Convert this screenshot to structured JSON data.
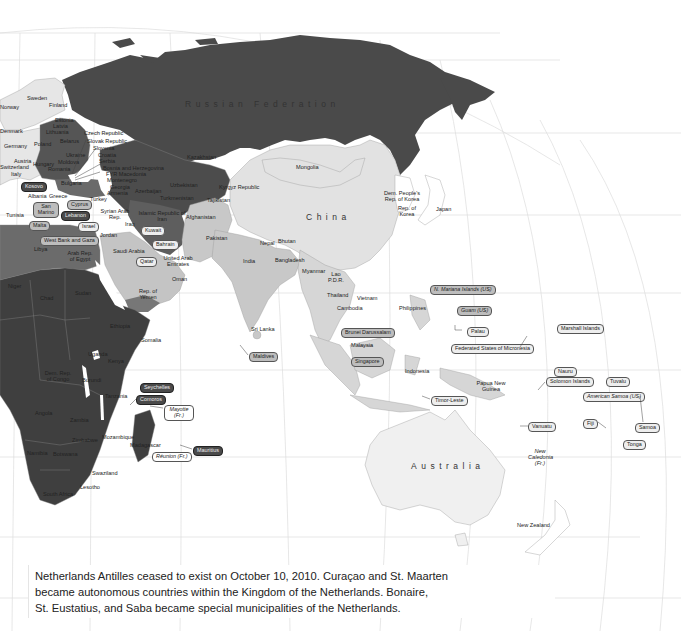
{
  "map": {
    "title": "",
    "colors": {
      "dark": "#3f3f3f",
      "darker": "#333333",
      "medium": "#6a6a6a",
      "light_gray": "#c8c8c8",
      "very_light": "#e3e3e3",
      "ocean": "#ffffff",
      "grid": "#d9d9d9"
    },
    "regions_large": {
      "russia": "Russian Federation",
      "china": "China",
      "australia": "Australia"
    },
    "labels": {
      "sweden": "Sweden",
      "finland": "Finland",
      "norway": "Norway",
      "estonia": "Estonia",
      "latvia": "Latvia",
      "lithuania": "Lithuania",
      "denmark": "Denmark",
      "czech": "Czech Republic",
      "slovak": "Slovak Republic",
      "slovenia": "Slovenia",
      "croatia": "Croatia",
      "serbia": "Serbia",
      "bosnia": "Bosnia and Herzegovina",
      "fyr": "FYR Macedonia",
      "montenegro": "Montenegro",
      "belarus": "Belarus",
      "poland": "Poland",
      "germany": "Germany",
      "ukraine": "Ukraine",
      "moldova": "Moldova",
      "romania": "Romania",
      "hungary": "Hungary",
      "austria": "Austria",
      "switzerland": "Switzerland",
      "italy": "Italy",
      "bulgaria": "Bulgaria",
      "albania": "Albania",
      "greece": "Greece",
      "georgia": "Georgia",
      "armenia": "Armenia",
      "azerbaijan": "Azerbaijan",
      "turkey": "Turkey",
      "kazakhstan": "Kazakhstan",
      "uzbekistan": "Uzbekistan",
      "turkmenistan": "Turkmenistan",
      "kyrgyz": "Kyrgyz Republic",
      "tajikistan": "Tajikistan",
      "iran": "Islamic Republic of Iran",
      "iraq": "Iraq",
      "syria": "Syrian Arab Rep.",
      "jordan": "Jordan",
      "afghanistan": "Afghanistan",
      "pakistan": "Pakistan",
      "india": "India",
      "nepal": "Nepal",
      "bhutan": "Bhutan",
      "bangladesh": "Bangladesh",
      "sri_lanka": "Sri Lanka",
      "myanmar": "Myanmar",
      "lao": "Lao P.D.R.",
      "thailand": "Thailand",
      "vietnam": "Vietnam",
      "cambodia": "Cambodia",
      "malaysia": "Malaysia",
      "indonesia": "Indonesia",
      "philippines": "Philippines",
      "png": "Papua New Guinea",
      "mongolia": "Mongolia",
      "dprk": "Dem. People's Rep. of Korea",
      "korea": "Rep. of Korea",
      "japan": "Japan",
      "saudi": "Saudi Arabia",
      "uae": "United Arab Emirates",
      "oman": "Oman",
      "yemen": "Rep. of Yemen",
      "egypt": "Arab Rep. of Egypt",
      "libya": "Libya",
      "tunisia": "Tunisia",
      "niger": "Niger",
      "chad": "Chad",
      "sudan": "Sudan",
      "ethiopia": "Ethiopia",
      "somalia": "Somalia",
      "kenya": "Kenya",
      "uganda": "Uganda",
      "tanzania": "Tanzania",
      "drc": "Dem. Rep. of Congo",
      "burundi": "Burundi",
      "angola": "Angola",
      "zambia": "Zambia",
      "zimbabwe": "Zimbabwe",
      "mozambique": "Mozambique",
      "madagascar": "Madagascar",
      "namibia": "Namibia",
      "botswana": "Botswana",
      "swaziland": "Swaziland",
      "lesotho": "Lesotho",
      "south_africa": "South Africa",
      "new_zealand": "New Zealand",
      "new_caledonia": "New Caledonia (Fr.)"
    },
    "callouts": [
      {
        "id": "kosovo",
        "label": "Kosovo",
        "style": "dark"
      },
      {
        "id": "san_marino",
        "label": "San Marino",
        "style": "mid"
      },
      {
        "id": "malta",
        "label": "Malta",
        "style": "mid"
      },
      {
        "id": "cyprus",
        "label": "Cyprus",
        "style": "mid"
      },
      {
        "id": "lebanon",
        "label": "Lebanon",
        "style": "dark"
      },
      {
        "id": "israel",
        "label": "Israel",
        "style": "light"
      },
      {
        "id": "west_bank",
        "label": "West Bank and Gaza",
        "style": "mid"
      },
      {
        "id": "kuwait",
        "label": "Kuwait",
        "style": "light"
      },
      {
        "id": "bahrain",
        "label": "Bahrain",
        "style": "light"
      },
      {
        "id": "qatar",
        "label": "Qatar",
        "style": "light"
      },
      {
        "id": "maldives",
        "label": "Maldives",
        "style": "mid"
      },
      {
        "id": "seychelles",
        "label": "Seychelles",
        "style": "dark"
      },
      {
        "id": "comoros",
        "label": "Comoros",
        "style": "dark"
      },
      {
        "id": "mayotte",
        "label": "Mayotte (Fr.)",
        "style": "white-italic"
      },
      {
        "id": "reunion",
        "label": "Réunion (Fr.)",
        "style": "white-italic"
      },
      {
        "id": "mauritius",
        "label": "Mauritius",
        "style": "dark"
      },
      {
        "id": "brunei",
        "label": "Brunei Darussalam",
        "style": "mid"
      },
      {
        "id": "singapore",
        "label": "Singapore",
        "style": "mid"
      },
      {
        "id": "timor",
        "label": "Timor-Leste",
        "style": "light"
      },
      {
        "id": "n_mariana",
        "label": "N. Mariana Islands (US)",
        "style": "mid-italic"
      },
      {
        "id": "guam",
        "label": "Guam (US)",
        "style": "mid-italic"
      },
      {
        "id": "palau",
        "label": "Palau",
        "style": "light"
      },
      {
        "id": "micronesia",
        "label": "Federated States of Micronesia",
        "style": "light"
      },
      {
        "id": "marshall",
        "label": "Marshall Islands",
        "style": "light"
      },
      {
        "id": "nauru",
        "label": "Nauru",
        "style": "light"
      },
      {
        "id": "solomon",
        "label": "Solomon Islands",
        "style": "light"
      },
      {
        "id": "tuvalu",
        "label": "Tuvalu",
        "style": "light"
      },
      {
        "id": "american_samoa",
        "label": "American Samoa (US)",
        "style": "light-italic"
      },
      {
        "id": "vanuatu",
        "label": "Vanuatu",
        "style": "light"
      },
      {
        "id": "fiji",
        "label": "Fiji",
        "style": "light"
      },
      {
        "id": "samoa",
        "label": "Samoa",
        "style": "light"
      },
      {
        "id": "tonga",
        "label": "Tonga",
        "style": "light"
      }
    ]
  },
  "caption": {
    "line1": "Netherlands Antilles ceased to exist on October 10, 2010. Curaçao and St. Maarten",
    "line2": "became autonomous countries within the Kingdom of the Netherlands. Bonaire,",
    "line3": "St. Eustatius, and Saba became special municipalities of the Netherlands."
  }
}
